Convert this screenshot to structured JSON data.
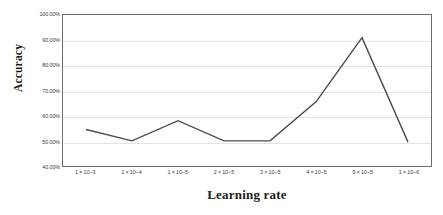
{
  "chart_data": {
    "type": "line",
    "title": "",
    "xlabel": "Learning rate",
    "ylabel": "Accuracy",
    "categories": [
      "1 × 10−3",
      "1 × 10−4",
      "1 × 10−5",
      "2 × 10−5",
      "3 × 10−5",
      "4 × 10−5",
      "5 × 10−5",
      "1 × 10−6"
    ],
    "values": [
      54.5,
      50.0,
      58.0,
      50.0,
      50.0,
      65.5,
      91.0,
      49.5
    ],
    "series": [
      {
        "name": "Accuracy",
        "values": [
          54.5,
          50.0,
          58.0,
          50.0,
          50.0,
          65.5,
          91.0,
          49.5
        ]
      }
    ],
    "ylim": [
      40,
      100
    ],
    "ytick_values": [
      40,
      50,
      60,
      70,
      80,
      90,
      100
    ],
    "ytick_labels": [
      "40.00%",
      "50.00%",
      "60.00%",
      "70.00%",
      "80.00%",
      "90.00%",
      "100.00%"
    ],
    "grid": true,
    "grid_axis": "y",
    "legend": false,
    "legend_position": "none",
    "line_color": "#4a4a4a",
    "line_width": 1.4,
    "markers": false,
    "plot_border_color": "#6e6e6e",
    "gridline_color": "#e4e4e4",
    "background_color": "#ffffff"
  }
}
